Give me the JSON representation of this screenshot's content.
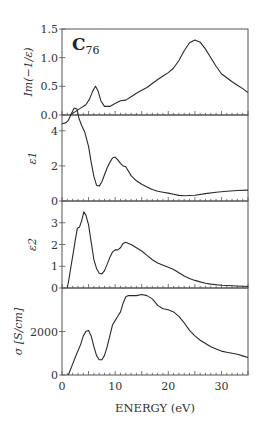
{
  "figure": {
    "title": "C",
    "title_subscript": "76",
    "xlabel": "ENERGY (eV)",
    "xlim": [
      0,
      35
    ],
    "xticks": [
      "0",
      "10",
      "20",
      "30"
    ]
  },
  "chart_data": [
    {
      "type": "line",
      "title": "C76",
      "ylabel": "Im(−1/ε)",
      "xlabel": "ENERGY (eV)",
      "xlim": [
        0,
        35
      ],
      "ylim": [
        0,
        1.5
      ],
      "yticks": [
        "0.0",
        "0.5",
        "1.0",
        "1.5"
      ],
      "grid": false,
      "x": [
        1.5,
        2.5,
        3.5,
        4.5,
        5.2,
        5.8,
        6.3,
        6.8,
        7.3,
        8.0,
        9.0,
        10.0,
        11.0,
        12.0,
        13.0,
        14.0,
        15.0,
        16.0,
        17.0,
        18.0,
        19.0,
        20.0,
        21.0,
        22.0,
        23.0,
        24.0,
        25.0,
        26.0,
        27.0,
        28.0,
        29.0,
        30.0,
        31.0,
        32.0,
        33.0,
        34.0,
        35.0
      ],
      "y": [
        0.0,
        0.06,
        0.12,
        0.18,
        0.28,
        0.42,
        0.5,
        0.42,
        0.25,
        0.15,
        0.15,
        0.2,
        0.25,
        0.26,
        0.32,
        0.38,
        0.43,
        0.48,
        0.55,
        0.62,
        0.68,
        0.74,
        0.82,
        0.95,
        1.12,
        1.26,
        1.31,
        1.27,
        1.15,
        1.0,
        0.85,
        0.72,
        0.65,
        0.58,
        0.52,
        0.46,
        0.39
      ]
    },
    {
      "type": "line",
      "ylabel": "ε1",
      "xlabel": "ENERGY (eV)",
      "xlim": [
        0,
        35
      ],
      "ylim": [
        0,
        4.9
      ],
      "yticks": [
        "0",
        "2",
        "4"
      ],
      "grid": false,
      "x": [
        0.0,
        0.7,
        1.2,
        1.8,
        2.3,
        2.8,
        3.2,
        3.7,
        4.3,
        5.0,
        5.5,
        6.0,
        6.5,
        7.0,
        7.5,
        8.0,
        8.5,
        9.0,
        9.5,
        10.0,
        10.5,
        11.0,
        11.5,
        12.0,
        13.0,
        14.0,
        15.0,
        16.0,
        17.0,
        18.0,
        19.0,
        20.0,
        21.0,
        22.0,
        23.0,
        25.0,
        27.0,
        29.0,
        31.0,
        33.0,
        35.0
      ],
      "y": [
        4.4,
        4.45,
        4.6,
        5.0,
        5.3,
        5.25,
        4.7,
        4.3,
        3.9,
        3.1,
        2.2,
        1.4,
        0.9,
        0.85,
        1.1,
        1.5,
        1.9,
        2.2,
        2.45,
        2.5,
        2.35,
        2.15,
        2.0,
        1.95,
        1.45,
        1.15,
        0.95,
        0.8,
        0.65,
        0.55,
        0.5,
        0.45,
        0.38,
        0.32,
        0.3,
        0.33,
        0.42,
        0.5,
        0.55,
        0.6,
        0.62
      ]
    },
    {
      "type": "line",
      "ylabel": "ε2",
      "xlabel": "ENERGY (eV)",
      "xlim": [
        0,
        35
      ],
      "ylim": [
        0,
        4
      ],
      "yticks": [
        "0",
        "1",
        "2",
        "3"
      ],
      "grid": false,
      "x": [
        1.0,
        1.3,
        1.7,
        2.1,
        2.5,
        2.9,
        3.3,
        3.7,
        4.1,
        4.5,
        5.0,
        5.5,
        6.0,
        6.5,
        7.0,
        7.5,
        8.0,
        8.5,
        9.0,
        9.5,
        10.0,
        10.5,
        11.0,
        11.5,
        12.0,
        12.5,
        13.0,
        14.0,
        15.0,
        16.0,
        17.0,
        18.0,
        19.0,
        20.0,
        21.0,
        22.0,
        23.0,
        24.0,
        25.0,
        26.0,
        27.0,
        28.0,
        30.0,
        32.0,
        35.0
      ],
      "y": [
        0.0,
        0.4,
        1.0,
        1.6,
        2.2,
        2.75,
        2.8,
        3.1,
        3.5,
        3.35,
        2.9,
        2.1,
        1.3,
        0.9,
        0.68,
        0.65,
        0.8,
        1.1,
        1.4,
        1.65,
        1.75,
        1.75,
        1.85,
        2.05,
        2.1,
        2.05,
        2.0,
        1.85,
        1.7,
        1.5,
        1.3,
        1.15,
        1.05,
        0.95,
        0.85,
        0.7,
        0.55,
        0.43,
        0.35,
        0.28,
        0.22,
        0.18,
        0.13,
        0.1,
        0.07
      ]
    },
    {
      "type": "line",
      "ylabel": "σ [S/cm]",
      "xlabel": "ENERGY (eV)",
      "xlim": [
        0,
        35
      ],
      "ylim": [
        0,
        4000
      ],
      "yticks": [
        "0",
        "2000"
      ],
      "grid": false,
      "x": [
        1.2,
        2.0,
        2.8,
        3.5,
        4.0,
        4.5,
        5.0,
        5.5,
        6.0,
        6.5,
        7.0,
        7.5,
        8.0,
        8.5,
        9.0,
        9.5,
        10.0,
        10.5,
        11.0,
        11.5,
        12.0,
        12.5,
        13.0,
        14.0,
        15.0,
        16.0,
        17.0,
        18.0,
        19.0,
        20.0,
        21.0,
        22.0,
        23.0,
        24.0,
        25.0,
        26.0,
        27.0,
        28.0,
        29.0,
        30.0,
        31.0,
        32.0,
        33.0,
        34.0,
        35.0
      ],
      "y": [
        0,
        500,
        1000,
        1400,
        1800,
        2000,
        2050,
        1800,
        1300,
        900,
        700,
        700,
        900,
        1300,
        1800,
        2300,
        2500,
        2700,
        2900,
        3300,
        3600,
        3650,
        3650,
        3650,
        3700,
        3650,
        3500,
        3200,
        3050,
        3000,
        2900,
        2700,
        2400,
        2050,
        1800,
        1600,
        1450,
        1300,
        1200,
        1100,
        1050,
        1000,
        950,
        880,
        800
      ]
    }
  ]
}
